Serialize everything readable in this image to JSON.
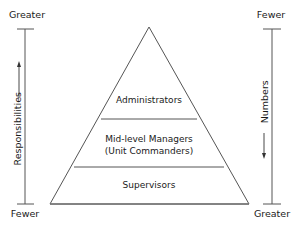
{
  "left_axis": {
    "title": "Responsibilities",
    "top_label": "Greater",
    "bottom_label": "Fewer",
    "arrow_direction": "up"
  },
  "right_axis": {
    "title": "Numbers",
    "top_label": "Fewer",
    "bottom_label": "Greater",
    "arrow_direction": "down"
  },
  "pyramid": {
    "tiers": [
      {
        "line1": "Administrators",
        "line2": ""
      },
      {
        "line1": "Mid-level Managers",
        "line2": "(Unit Commanders)"
      },
      {
        "line1": "Supervisors",
        "line2": ""
      }
    ]
  },
  "colors": {
    "line": "#555555",
    "text": "#1a1a1a"
  }
}
